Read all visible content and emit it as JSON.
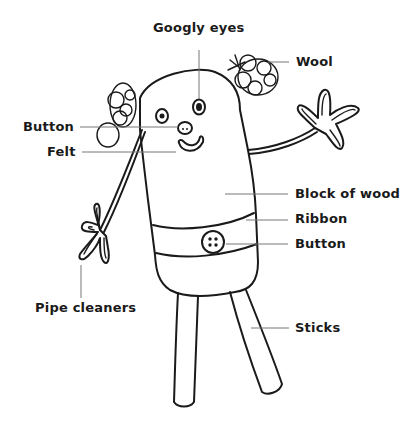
{
  "diagram": {
    "labels": [
      {
        "id": "googly-eyes",
        "text": "Googly eyes",
        "x": 153,
        "y": 20
      },
      {
        "id": "wool",
        "text": "Wool",
        "x": 296,
        "y": 58
      },
      {
        "id": "button-left",
        "text": "Button",
        "x": 23,
        "y": 119
      },
      {
        "id": "felt",
        "text": "Felt",
        "x": 47,
        "y": 145
      },
      {
        "id": "block-of-wood",
        "text": "Block of wood",
        "x": 295,
        "y": 186
      },
      {
        "id": "ribbon",
        "text": "Ribbon",
        "x": 295,
        "y": 211
      },
      {
        "id": "button-right",
        "text": "Button",
        "x": 295,
        "y": 235
      },
      {
        "id": "pipe-cleaners",
        "text": "Pipe cleaners",
        "x": 35,
        "y": 300
      },
      {
        "id": "sticks",
        "text": "Sticks",
        "x": 295,
        "y": 318
      }
    ],
    "colors": {
      "ink": "#1a1a1a",
      "leader": "#777777",
      "background": "#ffffff"
    }
  }
}
